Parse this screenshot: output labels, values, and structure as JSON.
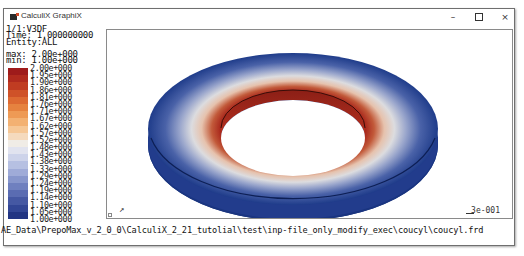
{
  "window": {
    "title": "CalculiX GraphiX",
    "controls": {
      "minimize": "–",
      "maximize": "",
      "close": "×"
    }
  },
  "info": {
    "lines": [
      "1/1:V3DF",
      "Time: 1.000000000",
      "Entity:ALL"
    ],
    "max": "max: 2.00e+000",
    "min": "min: 1.00e+000"
  },
  "colorbar": {
    "labels": [
      "2.00e+000",
      "1.95e+000",
      "1.90e+000",
      "1.86e+000",
      "1.81e+000",
      "1.76e+000",
      "1.71e+000",
      "1.67e+000",
      "1.62e+000",
      "1.57e+000",
      "1.52e+000",
      "1.48e+000",
      "1.43e+000",
      "1.38e+000",
      "1.33e+000",
      "1.29e+000",
      "1.24e+000",
      "1.19e+000",
      "1.14e+000",
      "1.10e+000",
      "1.05e+000",
      "1.00e+000"
    ],
    "colors": [
      "#9e1b1b",
      "#b02a1e",
      "#c03c22",
      "#cf5228",
      "#dd6a32",
      "#e6823f",
      "#ee9a55",
      "#f3b172",
      "#f6c795",
      "#f5dabd",
      "#f0ece6",
      "#e1e3ef",
      "#cdd3ea",
      "#b6c0e2",
      "#9fabd8",
      "#8796cc",
      "#6f80bf",
      "#5a6cb2",
      "#4558a3",
      "#324695",
      "#223583"
    ]
  },
  "viewport": {
    "scale_label": "3e-001",
    "triad_label": "xyz-axes",
    "model": {
      "outer_color": "#1f3c8a",
      "mid_color": "#e9e3de",
      "inner_color": "#a9281c",
      "side_color": "#1c357c"
    }
  },
  "status": {
    "file_path": "AE_Data\\PrepoMax_v_2_0_0\\CalculiX_2_21_tutolial\\test\\inp-file_only_modify_exec\\coucyl\\coucyl.frd"
  }
}
